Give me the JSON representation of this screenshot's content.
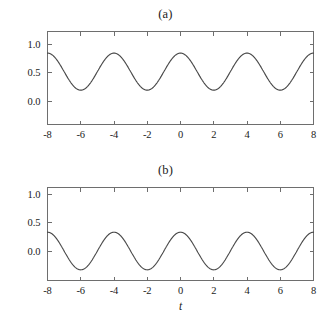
{
  "figure": {
    "background_color": "#ffffff",
    "curve_color": "#4a4a4a",
    "axis_color": "#6e6e6e"
  },
  "panels": {
    "a": {
      "title": "(a)",
      "xlabel": "",
      "ylabel": "",
      "xticklabels": [
        "-8",
        "-6",
        "-4",
        "-2",
        "0",
        "2",
        "4",
        "6",
        "8"
      ],
      "yticklabels": [
        "1.0",
        "0.5",
        "0.0"
      ]
    },
    "b": {
      "title": "(b)",
      "xlabel": "t",
      "ylabel": "",
      "xticklabels": [
        "-8",
        "-6",
        "-4",
        "-2",
        "0",
        "2",
        "4",
        "6",
        "8"
      ],
      "yticklabels": [
        "1.0",
        "0.5",
        "0.0"
      ]
    }
  },
  "chart_data": [
    {
      "type": "line",
      "title": "(a)",
      "xlabel": "",
      "ylabel": "",
      "xlim": [
        -8,
        8
      ],
      "ylim": [
        -0.12,
        1.2
      ],
      "xticks": [
        -8,
        -6,
        -4,
        -2,
        0,
        2,
        4,
        6,
        8
      ],
      "yticks": [
        1.0,
        0.5,
        0.0
      ],
      "grid": false,
      "legend": null,
      "series": [
        {
          "name": "cos-wave-offset",
          "description": "raised cosine, period 4, oscillating between 0.19 and 0.84",
          "formula": "0.515 + 0.325*cos(pi*t/2)",
          "mean": 0.515,
          "amplitude": 0.325,
          "period": 4,
          "ymin": 0.19,
          "ymax": 0.84,
          "x": [
            -8,
            -7.5,
            -7,
            -6.5,
            -6,
            -5.5,
            -5,
            -4.5,
            -4,
            -3.5,
            -3,
            -2.5,
            -2,
            -1.5,
            -1,
            -0.5,
            0,
            0.5,
            1,
            1.5,
            2,
            2.5,
            3,
            3.5,
            4,
            4.5,
            5,
            5.5,
            6,
            6.5,
            7,
            7.5,
            8
          ],
          "values": [
            0.84,
            0.745,
            0.515,
            0.285,
            0.19,
            0.285,
            0.515,
            0.745,
            0.84,
            0.745,
            0.515,
            0.285,
            0.19,
            0.285,
            0.515,
            0.745,
            0.84,
            0.745,
            0.515,
            0.285,
            0.19,
            0.285,
            0.515,
            0.745,
            0.84,
            0.745,
            0.515,
            0.285,
            0.19,
            0.285,
            0.515,
            0.745,
            0.84
          ]
        }
      ]
    },
    {
      "type": "line",
      "title": "(b)",
      "xlabel": "t",
      "ylabel": "",
      "xlim": [
        -8,
        8
      ],
      "ylim": [
        -0.45,
        1.2
      ],
      "xticks": [
        -8,
        -6,
        -4,
        -2,
        0,
        2,
        4,
        6,
        8
      ],
      "yticks": [
        1.0,
        0.5,
        0.0
      ],
      "grid": false,
      "legend": null,
      "series": [
        {
          "name": "cos-wave-zero-mean",
          "description": "zero-mean cosine, period 4, oscillating between -0.33 and 0.33",
          "formula": "0.33*cos(pi*t/2)",
          "mean": 0.0,
          "amplitude": 0.33,
          "period": 4,
          "ymin": -0.33,
          "ymax": 0.33,
          "x": [
            -8,
            -7.5,
            -7,
            -6.5,
            -6,
            -5.5,
            -5,
            -4.5,
            -4,
            -3.5,
            -3,
            -2.5,
            -2,
            -1.5,
            -1,
            -0.5,
            0,
            0.5,
            1,
            1.5,
            2,
            2.5,
            3,
            3.5,
            4,
            4.5,
            5,
            5.5,
            6,
            6.5,
            7,
            7.5,
            8
          ],
          "values": [
            0.33,
            0.233,
            0.0,
            -0.233,
            -0.33,
            -0.233,
            0.0,
            0.233,
            0.33,
            0.233,
            0.0,
            -0.233,
            -0.33,
            -0.233,
            0.0,
            0.233,
            0.33,
            0.233,
            0.0,
            -0.233,
            -0.33,
            -0.233,
            0.0,
            0.233,
            0.33,
            0.233,
            0.0,
            -0.233,
            -0.33,
            -0.233,
            0.0,
            0.233,
            0.33
          ]
        }
      ]
    }
  ]
}
